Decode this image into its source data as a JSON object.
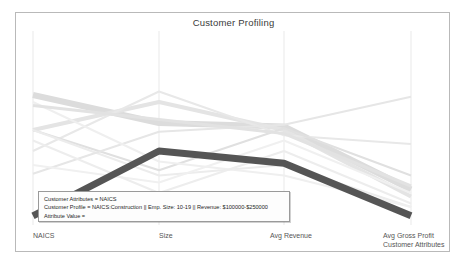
{
  "chart_data": {
    "type": "line",
    "subtype": "parallel-coordinates",
    "title": "Customer Profiling",
    "xlabel": "Customer Attributes",
    "ylabel": "",
    "grid": true,
    "legend": "none",
    "categories": [
      "NAICS",
      "Size",
      "Avg Revenue",
      "Avg Gross Profit"
    ],
    "axis_positions_px": [
      32,
      158,
      283,
      410
    ],
    "ylim": [
      0,
      1
    ],
    "highlight_color": "#555555",
    "background_color": "#ffffff",
    "series": [
      {
        "name": "NAICS:Construction || Emp. Size: 10-19 || Revenue: $100000-$250000",
        "highlighted": true,
        "color": "#555555",
        "width": 7,
        "values": [
          0.07,
          0.44,
          0.37,
          0.07
        ]
      },
      {
        "name": "profile-2",
        "highlighted": false,
        "color": "#dcdcdc",
        "width": 6,
        "values": [
          0.76,
          0.6,
          0.58,
          0.22
        ]
      },
      {
        "name": "profile-3",
        "highlighted": false,
        "color": "#e4e4e4",
        "width": 4,
        "values": [
          0.56,
          0.72,
          0.56,
          0.18
        ]
      },
      {
        "name": "profile-4",
        "highlighted": false,
        "color": "#e8e8e8",
        "width": 2,
        "values": [
          0.44,
          0.78,
          0.53,
          0.48
        ]
      },
      {
        "name": "profile-5",
        "highlighted": false,
        "color": "#e0e0e0",
        "width": 2,
        "values": [
          0.56,
          0.33,
          0.57,
          0.3
        ]
      },
      {
        "name": "profile-6",
        "highlighted": false,
        "color": "#ececec",
        "width": 2,
        "values": [
          0.56,
          0.3,
          0.36,
          0.12
        ]
      },
      {
        "name": "profile-7",
        "highlighted": false,
        "color": "#e6e6e6",
        "width": 2,
        "values": [
          0.31,
          0.55,
          0.59,
          0.75
        ]
      },
      {
        "name": "profile-8",
        "highlighted": false,
        "color": "#efefef",
        "width": 2,
        "values": [
          0.72,
          0.38,
          0.3,
          0.12
        ]
      },
      {
        "name": "profile-9",
        "highlighted": false,
        "color": "#e2e2e2",
        "width": 3,
        "values": [
          0.7,
          0.62,
          0.54,
          0.24
        ]
      },
      {
        "name": "profile-10",
        "highlighted": false,
        "color": "#f0f0f0",
        "width": 2,
        "values": [
          0.36,
          0.26,
          0.5,
          0.2
        ]
      },
      {
        "name": "profile-11",
        "highlighted": false,
        "color": "#ededed",
        "width": 2,
        "values": [
          0.5,
          0.2,
          0.44,
          0.14
        ]
      }
    ]
  },
  "tooltip": {
    "line1": "Customer Attributes = NAICS",
    "line2": "Customer Profile = NAICS:Construction || Emp. Size: 10-19 || Revenue: $100000-$250000",
    "line3": "Attribute Value ="
  }
}
